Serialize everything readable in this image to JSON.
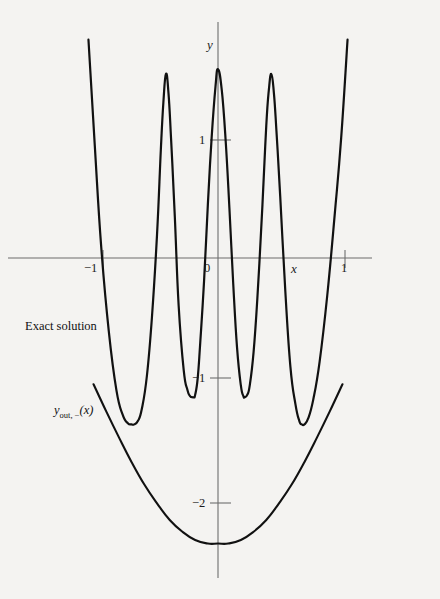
{
  "figure": {
    "background_color": "#f4f3f1",
    "curve_color": "#111111",
    "axis_color": "#6d6d6d"
  },
  "axes": {
    "x_axis_label": "x",
    "y_axis_label": "y",
    "origin_label": "0",
    "x_ticks": [
      {
        "value": -1,
        "label": "−1"
      },
      {
        "value": 1,
        "label": "1"
      }
    ],
    "y_ticks": [
      {
        "value": 1,
        "label": "1"
      },
      {
        "value": -1,
        "label": "−1"
      },
      {
        "value": -2,
        "label": "−2"
      }
    ]
  },
  "annotations": {
    "exact_solution_label": "Exact solution",
    "outer_solution_label_base": "y",
    "outer_solution_label_sub": "out, −",
    "outer_solution_label_arg": "(x)"
  },
  "caption": {
    "text": ""
  },
  "chart_data": {
    "type": "line",
    "title": "",
    "xlabel": "x",
    "ylabel": "y",
    "xlim": [
      -1.32,
      1.32
    ],
    "ylim": [
      -2.9,
      1.85
    ],
    "grid": false,
    "legend": "none",
    "x_tick_values": [
      -1,
      0,
      1
    ],
    "x_tick_labels": [
      "−1",
      "0",
      "1"
    ],
    "y_tick_values": [
      1,
      -1,
      -2
    ],
    "y_tick_labels": [
      "1",
      "−1",
      "−2"
    ],
    "series": [
      {
        "name": "Exact solution",
        "description": "Rapidly oscillating solution with three tall narrow peaks near x = -0.41, 0.00 and 0.42, sharp cusped minima between them, and steep outer branches falling off the bottom of the plot.",
        "peaks_x": [
          -0.41,
          0.0,
          0.42
        ],
        "peaks_y": [
          1.56,
          1.6,
          1.56
        ],
        "minima_x": [
          -0.66,
          -0.19,
          0.21,
          0.66
        ],
        "minima_y": [
          -1.41,
          -1.18,
          -1.18,
          -1.41
        ],
        "x": [
          -1.02,
          -0.97,
          -0.92,
          -0.86,
          -0.8,
          -0.75,
          -0.71,
          -0.68,
          -0.66,
          -0.63,
          -0.6,
          -0.56,
          -0.52,
          -0.48,
          -0.45,
          -0.43,
          -0.41,
          -0.39,
          -0.37,
          -0.34,
          -0.31,
          -0.27,
          -0.24,
          -0.22,
          -0.2,
          -0.19,
          -0.18,
          -0.16,
          -0.14,
          -0.11,
          -0.08,
          -0.05,
          -0.02,
          0.0,
          0.03,
          0.06,
          0.09,
          0.12,
          0.15,
          0.18,
          0.2,
          0.21,
          0.23,
          0.25,
          0.28,
          0.31,
          0.35,
          0.38,
          0.4,
          0.42,
          0.44,
          0.46,
          0.49,
          0.53,
          0.57,
          0.61,
          0.64,
          0.66,
          0.68,
          0.71,
          0.75,
          0.8,
          0.86,
          0.92,
          0.97,
          1.02
        ],
        "y": [
          1.85,
          0.95,
          0.1,
          -0.62,
          -1.12,
          -1.33,
          -1.4,
          -1.41,
          -1.41,
          -1.38,
          -1.28,
          -1.0,
          -0.5,
          0.2,
          0.92,
          1.32,
          1.56,
          1.4,
          1.02,
          0.35,
          -0.4,
          -0.95,
          -1.12,
          -1.17,
          -1.18,
          -1.18,
          -1.16,
          -1.02,
          -0.72,
          -0.2,
          0.45,
          1.02,
          1.45,
          1.6,
          1.42,
          1.0,
          0.42,
          -0.22,
          -0.76,
          -1.08,
          -1.17,
          -1.18,
          -1.16,
          -1.08,
          -0.8,
          -0.34,
          0.45,
          1.12,
          1.42,
          1.56,
          1.4,
          1.08,
          0.52,
          -0.28,
          -0.92,
          -1.24,
          -1.38,
          -1.41,
          -1.41,
          -1.36,
          -1.2,
          -0.88,
          -0.32,
          0.38,
          1.02,
          1.85
        ]
      },
      {
        "name": "y_out,-(x)",
        "description": "Smooth outer (slowly varying) solution: a shallow upward-opening curve with minimum about -2.42 at x = 0, drawn only over the interval from about x = -0.98 to x = 0.98.",
        "minimum_x": 0.0,
        "minimum_y": -2.42,
        "x": [
          -0.98,
          -0.88,
          -0.78,
          -0.68,
          -0.58,
          -0.48,
          -0.38,
          -0.28,
          -0.18,
          -0.08,
          0.0,
          0.08,
          0.18,
          0.28,
          0.38,
          0.48,
          0.58,
          0.68,
          0.78,
          0.88,
          0.98
        ],
        "y": [
          -1.07,
          -1.3,
          -1.52,
          -1.73,
          -1.92,
          -2.08,
          -2.22,
          -2.32,
          -2.39,
          -2.42,
          -2.42,
          -2.42,
          -2.39,
          -2.32,
          -2.22,
          -2.08,
          -1.92,
          -1.73,
          -1.52,
          -1.3,
          -1.07
        ]
      }
    ],
    "annotations": [
      {
        "text": "Exact solution",
        "x": -1.1,
        "y": -0.62
      },
      {
        "text": "y_out,-(x)",
        "x": -1.0,
        "y": -1.32
      }
    ]
  }
}
